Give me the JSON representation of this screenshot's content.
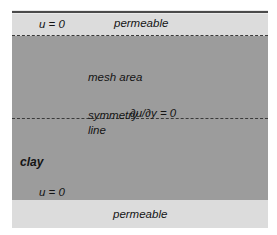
{
  "figure": {
    "kind": "schematic-diagram",
    "colors": {
      "page_background": "#ffffff",
      "plate_background": "#e9e9e9",
      "permeable_band": "#dcdcdc",
      "clay_block": "#9c9c9c",
      "line_dark": "#3a3a3a",
      "top_rule": "#4a4a4a",
      "text": "#141414"
    }
  },
  "labels": {
    "permeable_top": "permeable",
    "permeable_bottom": "permeable",
    "pore_pressure_top": "u = 0",
    "pore_pressure_bottom": "u = 0",
    "mesh_area": "mesh area",
    "symmetry_word": "symmetry",
    "line_word": "line",
    "flux_condition": "∂u/∂y = 0",
    "material": "clay"
  },
  "regions": [
    {
      "name": "top-permeable-boundary",
      "label": "permeable",
      "condition": "u = 0"
    },
    {
      "name": "mesh-area",
      "label": "mesh area"
    },
    {
      "name": "symmetry-line",
      "label": "symmetry line",
      "condition": "∂u/∂y = 0"
    },
    {
      "name": "clay-body",
      "label": "clay"
    },
    {
      "name": "bottom-permeable-boundary",
      "label": "permeable",
      "condition": "u = 0"
    }
  ]
}
